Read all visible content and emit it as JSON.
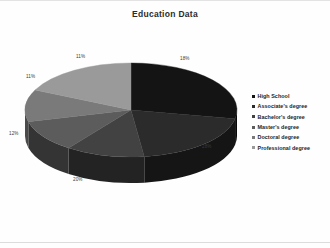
{
  "chart_data": {
    "type": "pie",
    "title": "Education Data",
    "xlabel": "",
    "ylabel": "",
    "legend_position": "right",
    "grid": false,
    "three_d": true,
    "start_angle_clock": 12,
    "direction": "clockwise",
    "categories": [
      "High School",
      "Associate's degree",
      "Bachelor's degree",
      "Master's degree",
      "Doctoral degree",
      "Professional degree"
    ],
    "values": [
      28,
      20,
      12,
      11,
      11,
      18
    ],
    "labels": [
      "28%",
      "20%",
      "12%",
      "11%",
      "11%",
      "18%"
    ],
    "colors": [
      "#141414",
      "#2b2b2b",
      "#424242",
      "#5c5c5c",
      "#7a7a7a",
      "#9a9a9a"
    ]
  },
  "title": {
    "text": "Education Data"
  },
  "pie": {
    "slices": [
      {
        "name": "High School",
        "value": 28,
        "label": "28%",
        "color": "#141414",
        "side_color": "#070707",
        "label_x": 202,
        "label_y": 143
      },
      {
        "name": "Associate's degree",
        "value": 20,
        "label": "20%",
        "color": "#2b2b2b",
        "side_color": "#151515",
        "label_x": 73,
        "label_y": 176
      },
      {
        "name": "Bachelor's degree",
        "value": 12,
        "label": "12%",
        "color": "#424242",
        "side_color": "#232323",
        "label_x": 9,
        "label_y": 130
      },
      {
        "name": "Master's degree",
        "value": 11,
        "label": "11%",
        "color": "#5c5c5c",
        "side_color": "#343434",
        "label_x": 26,
        "label_y": 73
      },
      {
        "name": "Doctoral degree",
        "value": 11,
        "label": "11%",
        "color": "#7a7a7a",
        "side_color": "#4a4a4a",
        "label_x": 76,
        "label_y": 53
      },
      {
        "name": "Professional degree",
        "value": 18,
        "label": "18%",
        "color": "#9a9a9a",
        "side_color": "#5e5e5e",
        "label_x": 180,
        "label_y": 55
      }
    ]
  },
  "legend": {
    "items": [
      {
        "label": "High School",
        "color": "#141414"
      },
      {
        "label": "Associate's degree",
        "color": "#2b2b2b"
      },
      {
        "label": "Bachelor's degree",
        "color": "#424242"
      },
      {
        "label": "Master's degree",
        "color": "#5c5c5c"
      },
      {
        "label": "Doctoral degree",
        "color": "#7a7a7a"
      },
      {
        "label": "Professional degree",
        "color": "#9a9a9a"
      }
    ]
  }
}
